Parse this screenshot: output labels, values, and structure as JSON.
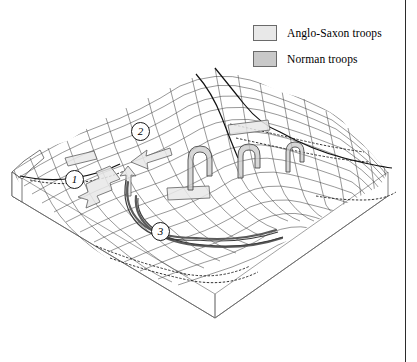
{
  "figure": {
    "background_color": "#ffffff",
    "width": 417,
    "height": 362
  },
  "legend": {
    "position": "top-right",
    "items": [
      {
        "id": "anglo-saxon",
        "label": "Anglo-Saxon troops",
        "swatch_fill": "#e8e8e8",
        "swatch_border": "#6a6a6a"
      },
      {
        "id": "norman",
        "label": "Norman troops",
        "swatch_fill": "#c9c9c9",
        "swatch_border": "#5a5a5a"
      }
    ]
  },
  "markers": [
    {
      "id": "marker-1",
      "label": "1",
      "x": 75,
      "y": 180
    },
    {
      "id": "marker-2",
      "label": "2",
      "x": 141,
      "y": 132
    },
    {
      "id": "marker-3",
      "label": "3",
      "x": 161,
      "y": 232
    }
  ],
  "terrain": {
    "style": "wireframe-mesh-block",
    "mesh_line_color": "#3a3a3a",
    "base_line_color": "#555555",
    "ridge_line_color": "#111111",
    "description": "Isometric block of undulating ridge terrain drawn as a quadrilateral wireframe net over a rectangular earth block."
  },
  "troop_symbols": {
    "anglo_saxon_fill": "#e8e8e8",
    "norman_fill": "#c9c9c9",
    "outline_color": "#555555",
    "shapes": [
      {
        "kind": "bar",
        "side": "anglo-saxon"
      },
      {
        "kind": "arrow",
        "side": "anglo-saxon"
      },
      {
        "kind": "arrow",
        "side": "anglo-saxon"
      },
      {
        "kind": "bar",
        "side": "anglo-saxon"
      },
      {
        "kind": "bar",
        "side": "anglo-saxon"
      },
      {
        "kind": "hook-arrow",
        "side": "norman"
      },
      {
        "kind": "hook-arrow",
        "side": "norman"
      },
      {
        "kind": "hook-arrow",
        "side": "norman"
      },
      {
        "kind": "curved-line",
        "side": "norman"
      },
      {
        "kind": "curved-line",
        "side": "norman"
      }
    ]
  }
}
